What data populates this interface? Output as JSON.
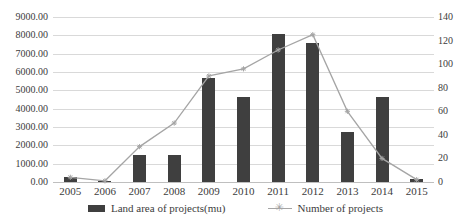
{
  "chart_data": {
    "type": "combo-bar-line",
    "title": "",
    "categories": [
      "2005",
      "2006",
      "2007",
      "2008",
      "2009",
      "2010",
      "2011",
      "2012",
      "2013",
      "2014",
      "2015"
    ],
    "series": [
      {
        "name": "Land area of projects(mu)",
        "type": "bar",
        "axis": "left",
        "color": "#3f3f3f",
        "values": [
          250,
          50,
          1450,
          1500,
          5700,
          4650,
          8100,
          7600,
          2750,
          4650,
          150
        ]
      },
      {
        "name": "Number of projects",
        "type": "line",
        "axis": "right",
        "color": "#a5a5a5",
        "marker": "star",
        "values": [
          4,
          1,
          30,
          50,
          90,
          96,
          112,
          125,
          60,
          20,
          2
        ]
      }
    ],
    "left_axis": {
      "min": 0,
      "max": 9000,
      "step": 1000,
      "tick_labels": [
        "9000.00",
        "8000.00",
        "7000.00",
        "6000.00",
        "5000.00",
        "4000.00",
        "3000.00",
        "2000.00",
        "1000.00",
        "0.00"
      ]
    },
    "right_axis": {
      "min": 0,
      "max": 140,
      "step": 20,
      "tick_labels": [
        "140",
        "120",
        "100",
        "80",
        "60",
        "40",
        "20",
        "0"
      ]
    },
    "grid": true,
    "gridline_color": "#d9d9d9",
    "legend_position": "bottom"
  },
  "legend": {
    "bar_label": "Land area of projects(mu)",
    "line_label": "Number of projects",
    "line_marker_glyph": "✳"
  }
}
